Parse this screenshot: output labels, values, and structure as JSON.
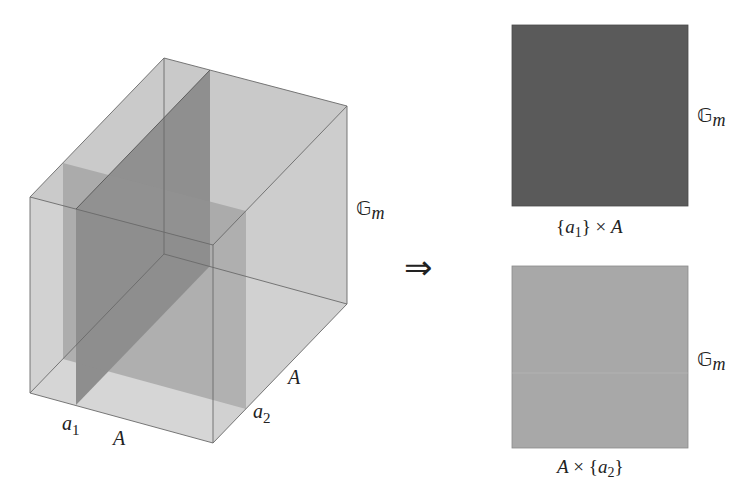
{
  "figure": {
    "cube": {
      "vertical_label": "𝔾",
      "vertical_label_sub": "m",
      "depth_label": "A",
      "width_label": "A",
      "a1_label": "a",
      "a1_sub": "1",
      "a2_label": "a",
      "a2_sub": "2"
    },
    "arrow": "⇒",
    "panels": [
      {
        "side_label": "𝔾",
        "side_label_sub": "m",
        "caption_pre": "{",
        "caption_var": "a",
        "caption_sub": "1",
        "caption_post": "} × ",
        "caption_set": "A",
        "fill": "#5a5a5a"
      },
      {
        "side_label": "𝔾",
        "side_label_sub": "m",
        "caption_set": "A",
        "caption_pre": " × {",
        "caption_var": "a",
        "caption_sub": "2",
        "caption_post": "}",
        "fill": "#a8a8a8"
      }
    ]
  },
  "colors": {
    "cube_face": "#b4b4b4",
    "plane_a1": "#5c5c5c",
    "plane_a2": "#8e8e8e",
    "edge": "#6a6a6a"
  }
}
